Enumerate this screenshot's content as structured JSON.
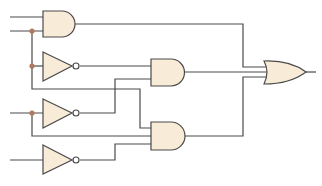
{
  "diagram": {
    "type": "logic-circuit",
    "colors": {
      "wire": "#4a4a4a",
      "gate_fill": "#f8ecd9",
      "junction": "#b07a5e",
      "background": "#ffffff"
    },
    "gates": [
      {
        "id": "and1",
        "kind": "AND",
        "inputs": 2
      },
      {
        "id": "not1",
        "kind": "NOT",
        "inputs": 1
      },
      {
        "id": "and2",
        "kind": "AND",
        "inputs": 2
      },
      {
        "id": "not2",
        "kind": "NOT",
        "inputs": 1
      },
      {
        "id": "and3",
        "kind": "AND",
        "inputs": 3
      },
      {
        "id": "not3",
        "kind": "NOT",
        "inputs": 1
      },
      {
        "id": "or1",
        "kind": "OR",
        "inputs": 3
      }
    ],
    "inputs": 4,
    "junctions": 3,
    "outputs": 1
  }
}
